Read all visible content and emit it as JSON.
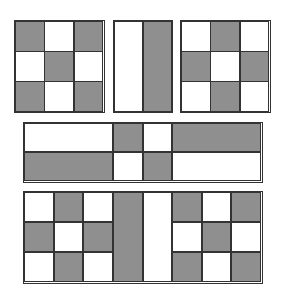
{
  "colors": {
    "gray": "#8f8f8f",
    "white": "#ffffff",
    "line": "#333333"
  },
  "blocks": [
    {
      "name": "top-left-checker",
      "x": 14,
      "y": 20,
      "w": 91,
      "h": 93,
      "rows": 3,
      "cols": 3,
      "pattern": [
        [
          "g",
          "w",
          "g"
        ],
        [
          "w",
          "g",
          "w"
        ],
        [
          "g",
          "w",
          "g"
        ]
      ]
    },
    {
      "name": "top-middle-stripes",
      "x": 113,
      "y": 20,
      "w": 60,
      "h": 93,
      "rows": 1,
      "cols": 2,
      "pattern": [
        [
          "w",
          "g"
        ]
      ]
    },
    {
      "name": "top-right-checker",
      "x": 180,
      "y": 20,
      "w": 91,
      "h": 93,
      "rows": 3,
      "cols": 3,
      "pattern": [
        [
          "w",
          "g",
          "w"
        ],
        [
          "g",
          "w",
          "g"
        ],
        [
          "w",
          "g",
          "w"
        ]
      ]
    },
    {
      "name": "middle-band",
      "x": 23,
      "y": 122,
      "w": 240,
      "h": 61,
      "custom": "middle"
    },
    {
      "name": "bottom-band",
      "x": 23,
      "y": 191,
      "w": 240,
      "h": 93,
      "custom": "bottom"
    }
  ]
}
